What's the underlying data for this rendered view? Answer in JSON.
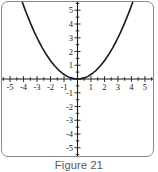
{
  "figure": {
    "caption": "Figure 21",
    "frame_color": "#8a8a8a",
    "background": "#ffffff"
  },
  "chart_data": {
    "type": "line",
    "title": "",
    "subtitle": "",
    "xlabel": "",
    "ylabel": "",
    "xlim": [
      -5.6,
      5.6
    ],
    "ylim": [
      -5.6,
      5.6
    ],
    "grid": false,
    "legend": null,
    "axis_color": "#1a1a1a",
    "curve_color": "#1a1a1a",
    "curve_width": 1.6,
    "equation": "y = x^2 / 3",
    "vertex": [
      0,
      0
    ],
    "x_tick_labels": [
      "-5",
      "-4",
      "-3",
      "-2",
      "-1",
      "1",
      "2",
      "3",
      "4",
      "5"
    ],
    "x_tick_values": [
      -5,
      -4,
      -3,
      -2,
      -1,
      1,
      2,
      3,
      4,
      5
    ],
    "y_tick_labels": [
      "5",
      "4",
      "3",
      "2",
      "1",
      "-1",
      "-2",
      "-3",
      "-4",
      "-5"
    ],
    "y_tick_values": [
      5,
      4,
      3,
      2,
      1,
      -1,
      -2,
      -3,
      -4,
      -5
    ],
    "minor_tick_step": 0.5,
    "x": [
      -4.1,
      -3.8,
      -3.5,
      -3.2,
      -2.9,
      -2.6,
      -2.3,
      -2.0,
      -1.7,
      -1.4,
      -1.1,
      -0.8,
      -0.5,
      -0.2,
      0,
      0.2,
      0.5,
      0.8,
      1.1,
      1.4,
      1.7,
      2.0,
      2.3,
      2.6,
      2.9,
      3.2,
      3.5,
      3.8,
      4.1
    ],
    "y": [
      5.6,
      4.81,
      4.08,
      3.41,
      2.8,
      2.25,
      1.76,
      1.33,
      0.96,
      0.65,
      0.4,
      0.21,
      0.08,
      0.01,
      0,
      0.01,
      0.08,
      0.21,
      0.4,
      0.65,
      0.96,
      1.33,
      1.76,
      2.25,
      2.8,
      3.41,
      4.08,
      4.81,
      5.6
    ]
  }
}
